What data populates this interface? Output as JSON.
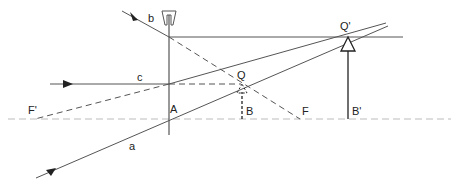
{
  "diagram": {
    "type": "optics-ray-diagram",
    "colors": {
      "line": "#555555",
      "dark": "#222222",
      "axis": "#bbbbbb",
      "background": "#ffffff"
    },
    "labels": {
      "ray_a": "a",
      "ray_b": "b",
      "ray_c": "c",
      "lens_center": "A",
      "focal_left": "F'",
      "focal_right": "F",
      "image_point": "Q",
      "image_base": "B",
      "object_point": "Q'",
      "object_base": "B'"
    },
    "elements": {
      "optical_axis": "dashed horizontal line",
      "lens": "diverging lens (concave symbol)",
      "object": "solid arrow B'Q'",
      "image": "dashed arrow BQ (virtual)"
    }
  }
}
